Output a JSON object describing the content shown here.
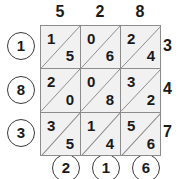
{
  "figure": {
    "kind": "lattice-multiplication-grid",
    "rows": 3,
    "cols": 3
  },
  "top_labels": [
    "5",
    "2",
    "8"
  ],
  "left_labels": [
    "1",
    "8",
    "3"
  ],
  "right_labels": [
    "3",
    "4",
    "7"
  ],
  "bottom_labels": [
    "2",
    "1",
    "6"
  ],
  "cells": [
    [
      {
        "tens": "1",
        "ones": "5"
      },
      {
        "tens": "0",
        "ones": "6"
      },
      {
        "tens": "2",
        "ones": "4"
      }
    ],
    [
      {
        "tens": "2",
        "ones": "0"
      },
      {
        "tens": "0",
        "ones": "8"
      },
      {
        "tens": "3",
        "ones": "2"
      }
    ],
    [
      {
        "tens": "3",
        "ones": "5"
      },
      {
        "tens": "1",
        "ones": "4"
      },
      {
        "tens": "5",
        "ones": "6"
      }
    ]
  ],
  "colors": {
    "cell_fill": "#f1f1f1",
    "grid_line": "#8c8c8c",
    "circle_stroke": "#3a3a3a",
    "text": "#1a1a1a"
  }
}
